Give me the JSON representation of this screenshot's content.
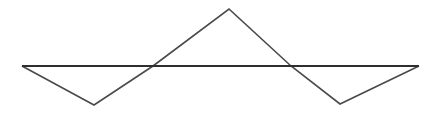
{
  "figure": {
    "width": 440,
    "height": 116,
    "background_color": "#ffffff",
    "stroke_color": "#4a4a4a",
    "baseline_stroke_color": "#2e2e2e",
    "baseline_stroke_width": 2.2,
    "zigzag_stroke_width": 1.6
  },
  "chart_data": {
    "type": "line",
    "xlabel": "",
    "ylabel": "",
    "xlim": [
      0,
      440
    ],
    "ylim": [
      116,
      0
    ],
    "grid": false,
    "legend": "none",
    "series": [
      {
        "name": "baseline",
        "points": [
          [
            22,
            66
          ],
          [
            419,
            66
          ]
        ]
      },
      {
        "name": "zigzag",
        "points": [
          [
            22,
            66
          ],
          [
            94,
            105
          ],
          [
            153,
            66
          ],
          [
            229,
            9
          ],
          [
            291,
            66
          ],
          [
            340,
            104
          ],
          [
            419,
            66
          ]
        ]
      }
    ],
    "annotations": [
      {
        "name": "left-endpoint",
        "x": 22,
        "y": 66
      },
      {
        "name": "left-valley",
        "x": 94,
        "y": 105
      },
      {
        "name": "left-crossing",
        "x": 153,
        "y": 66
      },
      {
        "name": "apex",
        "x": 229,
        "y": 9
      },
      {
        "name": "right-crossing",
        "x": 291,
        "y": 66
      },
      {
        "name": "right-valley",
        "x": 340,
        "y": 104
      },
      {
        "name": "right-endpoint",
        "x": 419,
        "y": 66
      }
    ]
  }
}
